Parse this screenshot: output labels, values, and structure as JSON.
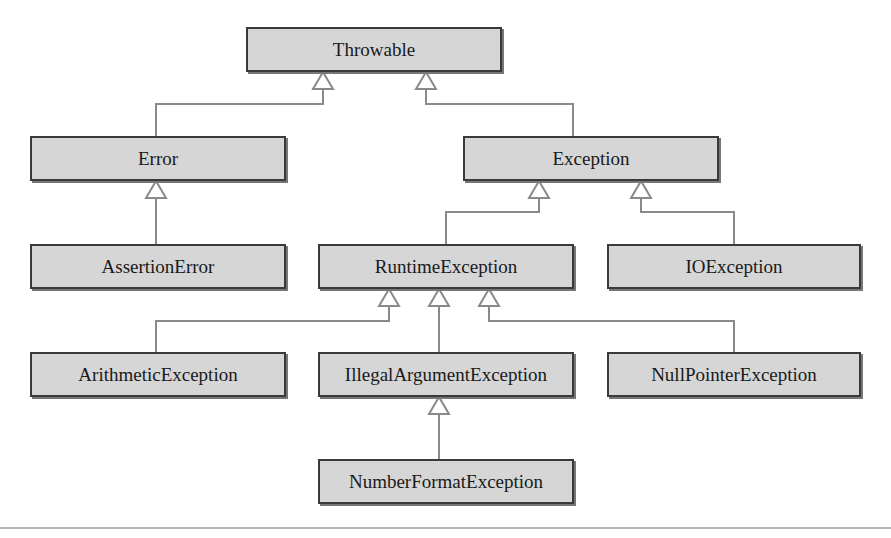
{
  "diagram": {
    "type": "class-hierarchy",
    "relationship": "inheritance",
    "nodes": {
      "throwable": "Throwable",
      "error": "Error",
      "exception": "Exception",
      "assertion_error": "AssertionError",
      "runtime_exception": "RuntimeException",
      "io_exception": "IOException",
      "arithmetic_exception": "ArithmeticException",
      "illegal_argument_exception": "IllegalArgumentException",
      "null_pointer_exception": "NullPointerException",
      "number_format_exception": "NumberFormatException"
    },
    "edges": [
      {
        "child": "Error",
        "parent": "Throwable"
      },
      {
        "child": "Exception",
        "parent": "Throwable"
      },
      {
        "child": "AssertionError",
        "parent": "Error"
      },
      {
        "child": "RuntimeException",
        "parent": "Exception"
      },
      {
        "child": "IOException",
        "parent": "Exception"
      },
      {
        "child": "ArithmeticException",
        "parent": "RuntimeException"
      },
      {
        "child": "IllegalArgumentException",
        "parent": "RuntimeException"
      },
      {
        "child": "NullPointerException",
        "parent": "RuntimeException"
      },
      {
        "child": "NumberFormatException",
        "parent": "IllegalArgumentException"
      }
    ],
    "colors": {
      "box_fill": "#d6d6d6",
      "box_border": "#3a3a3a",
      "connector": "#8a8a8a",
      "rule": "#b4b4b4"
    }
  }
}
